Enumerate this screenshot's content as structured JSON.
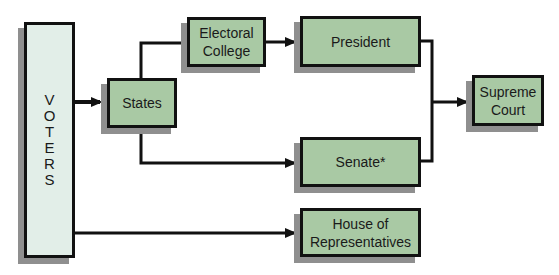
{
  "diagram": {
    "type": "flowchart",
    "nodes": {
      "voters": {
        "label": "VOTERS",
        "letters": [
          "V",
          "O",
          "T",
          "E",
          "R",
          "S"
        ]
      },
      "states": {
        "label": "States"
      },
      "electoral_college": {
        "line1": "Electoral",
        "line2": "College"
      },
      "president": {
        "label": "President"
      },
      "senate": {
        "label": "Senate*"
      },
      "house": {
        "line1": "House of",
        "line2": "Representatives"
      },
      "supreme_court": {
        "line1": "Supreme",
        "line2": "Court"
      }
    },
    "edges": [
      {
        "from": "VOTERS",
        "to": "States"
      },
      {
        "from": "States",
        "to": "Electoral College"
      },
      {
        "from": "States",
        "to": "Senate*"
      },
      {
        "from": "Electoral College",
        "to": "President"
      },
      {
        "from": "President",
        "to": "Supreme Court"
      },
      {
        "from": "Senate*",
        "to": "Supreme Court"
      },
      {
        "from": "VOTERS",
        "to": "House of Representatives"
      }
    ],
    "colors": {
      "node_fill": "#a9c9a4",
      "voters_fill": "#e2eee8",
      "border": "#111111",
      "shadow": "#8f8f8f"
    }
  }
}
